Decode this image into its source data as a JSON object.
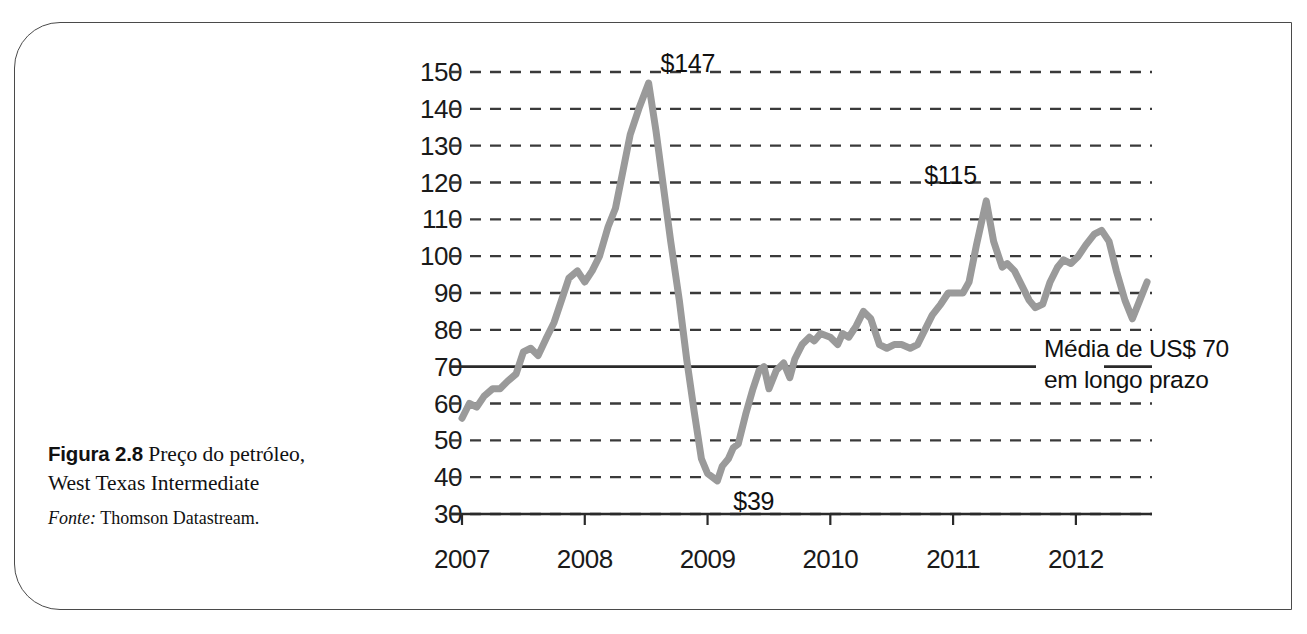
{
  "caption": {
    "figure_number": "Figura 2.8",
    "title_line1": "Preço do petróleo,",
    "title_line2": "West Texas Intermediate",
    "source_label": "Fonte:",
    "source_value": "Thomson Datastream."
  },
  "chart_data": {
    "type": "line",
    "title": "Preço do petróleo, West Texas Intermediate",
    "xlabel": "",
    "ylabel": "",
    "xlim": [
      2007.0,
      2012.62
    ],
    "ylim": [
      30,
      150
    ],
    "ytick_values": [
      150,
      140,
      130,
      120,
      110,
      100,
      90,
      80,
      70,
      60,
      50,
      40,
      30
    ],
    "xtick_labels": [
      "2007",
      "2008",
      "2009",
      "2010",
      "2011",
      "2012"
    ],
    "xtick_values": [
      2007,
      2008,
      2009,
      2010,
      2011,
      2012
    ],
    "grid": true,
    "grid_style": "dashed",
    "legend": "none",
    "line_color": "#9a9a9a",
    "line_width": 7,
    "reference_line": {
      "value": 70,
      "style": "solid",
      "color": "#3a3a3a",
      "label_line1": "Média de US$ 70",
      "label_line2": "em longo prazo"
    },
    "annotations": [
      {
        "text": "$147",
        "x": 2008.52,
        "y": 147
      },
      {
        "text": "$39",
        "x": 2009.08,
        "y": 39
      },
      {
        "text": "$115",
        "x": 2011.27,
        "y": 115
      }
    ],
    "series": [
      {
        "name": "WTI spot price (US$/barrel)",
        "points": [
          [
            2007.0,
            56
          ],
          [
            2007.06,
            60
          ],
          [
            2007.12,
            59
          ],
          [
            2007.18,
            62
          ],
          [
            2007.25,
            64
          ],
          [
            2007.31,
            64
          ],
          [
            2007.37,
            66
          ],
          [
            2007.44,
            68
          ],
          [
            2007.5,
            74
          ],
          [
            2007.56,
            75
          ],
          [
            2007.62,
            73
          ],
          [
            2007.69,
            78
          ],
          [
            2007.75,
            82
          ],
          [
            2007.81,
            88
          ],
          [
            2007.87,
            94
          ],
          [
            2007.94,
            96
          ],
          [
            2008.0,
            93
          ],
          [
            2008.06,
            96
          ],
          [
            2008.12,
            100
          ],
          [
            2008.19,
            108
          ],
          [
            2008.25,
            113
          ],
          [
            2008.31,
            123
          ],
          [
            2008.37,
            133
          ],
          [
            2008.44,
            140
          ],
          [
            2008.52,
            147
          ],
          [
            2008.58,
            134
          ],
          [
            2008.64,
            119
          ],
          [
            2008.7,
            104
          ],
          [
            2008.77,
            88
          ],
          [
            2008.83,
            72
          ],
          [
            2008.89,
            58
          ],
          [
            2008.95,
            45
          ],
          [
            2009.0,
            41
          ],
          [
            2009.04,
            40
          ],
          [
            2009.08,
            39
          ],
          [
            2009.12,
            43
          ],
          [
            2009.17,
            45
          ],
          [
            2009.21,
            48
          ],
          [
            2009.25,
            49
          ],
          [
            2009.31,
            57
          ],
          [
            2009.37,
            64
          ],
          [
            2009.42,
            69
          ],
          [
            2009.46,
            70
          ],
          [
            2009.5,
            64
          ],
          [
            2009.56,
            69
          ],
          [
            2009.62,
            71
          ],
          [
            2009.67,
            67
          ],
          [
            2009.71,
            72
          ],
          [
            2009.77,
            76
          ],
          [
            2009.83,
            78
          ],
          [
            2009.87,
            77
          ],
          [
            2009.92,
            79
          ],
          [
            2010.0,
            78
          ],
          [
            2010.06,
            76
          ],
          [
            2010.1,
            79
          ],
          [
            2010.15,
            78
          ],
          [
            2010.21,
            81
          ],
          [
            2010.27,
            85
          ],
          [
            2010.33,
            83
          ],
          [
            2010.4,
            76
          ],
          [
            2010.46,
            75
          ],
          [
            2010.52,
            76
          ],
          [
            2010.58,
            76
          ],
          [
            2010.65,
            75
          ],
          [
            2010.71,
            76
          ],
          [
            2010.77,
            80
          ],
          [
            2010.83,
            84
          ],
          [
            2010.9,
            87
          ],
          [
            2010.96,
            90
          ],
          [
            2011.02,
            90
          ],
          [
            2011.08,
            90
          ],
          [
            2011.13,
            93
          ],
          [
            2011.19,
            103
          ],
          [
            2011.27,
            115
          ],
          [
            2011.33,
            104
          ],
          [
            2011.4,
            97
          ],
          [
            2011.44,
            98
          ],
          [
            2011.5,
            96
          ],
          [
            2011.56,
            92
          ],
          [
            2011.62,
            88
          ],
          [
            2011.67,
            86
          ],
          [
            2011.73,
            87
          ],
          [
            2011.79,
            93
          ],
          [
            2011.85,
            97
          ],
          [
            2011.9,
            99
          ],
          [
            2011.96,
            98
          ],
          [
            2012.02,
            100
          ],
          [
            2012.08,
            103
          ],
          [
            2012.15,
            106
          ],
          [
            2012.21,
            107
          ],
          [
            2012.27,
            104
          ],
          [
            2012.33,
            96
          ],
          [
            2012.4,
            88
          ],
          [
            2012.46,
            83
          ],
          [
            2012.52,
            88
          ],
          [
            2012.58,
            93
          ]
        ]
      }
    ]
  }
}
